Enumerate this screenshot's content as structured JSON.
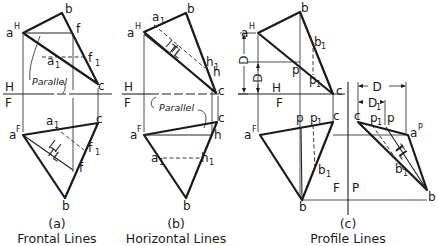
{
  "panels": {
    "a": {
      "letter": "(a)",
      "caption": "Frontal Lines",
      "top": {
        "a": "a",
        "a_sup": "H",
        "b": "b",
        "f": "f",
        "f1": "f",
        "f1_sub": "1",
        "a1": "a",
        "a1_sub": "1",
        "c": "c"
      },
      "bottom": {
        "a": "a",
        "a_sup": "F",
        "a1": "a",
        "a1_sub": "1",
        "c": "c",
        "f1": "f",
        "f1_sub": "1",
        "f": "f",
        "b": "b",
        "tl": "TL"
      },
      "parallel_label": "Parallel",
      "fold_top": "H",
      "fold_bottom": "F"
    },
    "b": {
      "letter": "(b)",
      "caption": "Horizontal Lines",
      "top": {
        "a": "a",
        "a_sup": "H",
        "a1": "a",
        "a1_sub": "1",
        "b": "b",
        "h1": "h",
        "h1_sub": "1",
        "h": "h",
        "c": "c",
        "tl": "TL"
      },
      "bottom": {
        "a": "a",
        "a_sup": "F",
        "c": "c",
        "h": "h",
        "a1": "a",
        "a1_sub": "1",
        "h1": "h",
        "h1_sub": "1",
        "b": "b"
      },
      "parallel_label": "Parallel",
      "fold_top": "H",
      "fold_bottom": "F"
    },
    "c": {
      "letter": "(c)",
      "caption": "Profile Lines",
      "top": {
        "a": "a",
        "a_sup": "H",
        "b": "b",
        "b1": "b",
        "b1_sub": "1",
        "p": "p",
        "p1": "p",
        "p1_sub": "1",
        "c": "c",
        "dim_D": "D",
        "dim_D1": "D",
        "dim_D1_sub": "1"
      },
      "bottom": {
        "a": "a",
        "a_sup": "F",
        "p": "p",
        "p1": "p",
        "p1_sub": "1",
        "c": "c",
        "b1": "b",
        "b1_sub": "1",
        "b": "b"
      },
      "profile": {
        "c": "c",
        "p1": "p",
        "p1_sub": "1",
        "p": "p",
        "a": "a",
        "a_sup": "P",
        "b1": "b",
        "b1_sub": "1",
        "b": "b",
        "tl": "TL",
        "dim_D": "D",
        "dim_D1": "D",
        "dim_D1_sub": "1"
      },
      "fold_top": "H",
      "fold_bottom": "F",
      "fold_fp_left": "F",
      "fold_fp_right": "P"
    }
  },
  "colors": {
    "ink": "#1a1a1a",
    "background": "#ffffff"
  }
}
